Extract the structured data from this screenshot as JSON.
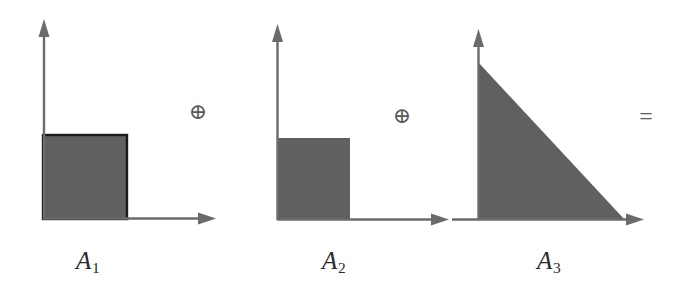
{
  "figure": {
    "background_color": "#ffffff",
    "axis_color": "#6b6b6b",
    "fill_color": "#606060",
    "outline_color": "#1a1a1a",
    "text_color": "#2b2b2b",
    "width": 691,
    "height": 294
  },
  "operators": [
    {
      "id": "plus-1",
      "symbol": "⊕",
      "name": "circled-plus",
      "x": 196,
      "y": 113
    },
    {
      "id": "plus-2",
      "symbol": "⊕",
      "name": "circled-plus",
      "x": 400,
      "y": 117
    },
    {
      "id": "equals",
      "symbol": "=",
      "name": "equals",
      "x": 645,
      "y": 118
    }
  ],
  "panels": [
    {
      "id": "panel-1",
      "label_letter": "A",
      "label_index": "1",
      "label_full": "A1",
      "shape": "square",
      "shape_name": "filled-square-with-outline",
      "origin": {
        "x": 43,
        "y": 219
      },
      "shape_bounds": {
        "x": 43,
        "y": 135,
        "width": 84,
        "height": 84
      },
      "y_axis": {
        "from_y": 219,
        "to_y": 20
      },
      "x_axis": {
        "from_x": 43,
        "to_x": 215
      },
      "has_outline": true
    },
    {
      "id": "panel-2",
      "label_letter": "A",
      "label_index": "2",
      "label_full": "A2",
      "shape": "square",
      "shape_name": "filled-square",
      "origin": {
        "x": 277,
        "y": 220
      },
      "shape_bounds": {
        "x": 277,
        "y": 138,
        "width": 73,
        "height": 82
      },
      "y_axis": {
        "from_y": 220,
        "to_y": 25
      },
      "x_axis": {
        "from_x": 277,
        "to_x": 448
      },
      "has_outline": false
    },
    {
      "id": "panel-3",
      "label_letter": "A",
      "label_index": "3",
      "label_full": "A3",
      "shape": "triangle",
      "shape_name": "filled-right-triangle",
      "origin": {
        "x": 478,
        "y": 220
      },
      "shape_bounds": {
        "x": 478,
        "y": 62,
        "width": 147,
        "height": 158
      },
      "vertices": [
        {
          "x": 478,
          "y": 62
        },
        {
          "x": 478,
          "y": 220
        },
        {
          "x": 625,
          "y": 220
        }
      ],
      "y_axis": {
        "from_y": 220,
        "to_y": 30
      },
      "x_axis": {
        "from_x": 452,
        "to_x": 643
      },
      "has_outline": false
    }
  ]
}
